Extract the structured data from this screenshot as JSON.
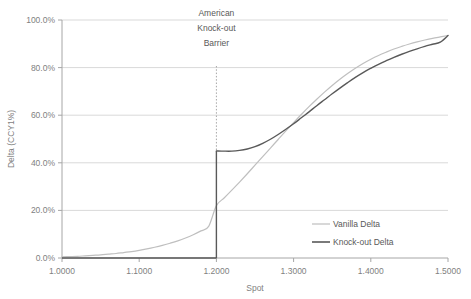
{
  "chart_data": {
    "type": "line",
    "title": "",
    "xlabel": "Spot",
    "ylabel": "Delta (CCY1%)",
    "xlim": [
      1.0,
      1.5
    ],
    "ylim": [
      0.0,
      1.0
    ],
    "grid": true,
    "legend_position": "inside-bottom-right",
    "x_tick_labels": [
      "1.0000",
      "1.1000",
      "1.2000",
      "1.3000",
      "1.4000",
      "1.5000"
    ],
    "x_ticks": [
      1.0,
      1.1,
      1.2,
      1.3,
      1.4,
      1.5
    ],
    "y_tick_labels": [
      "0.0%",
      "20.0%",
      "40.0%",
      "60.0%",
      "80.0%",
      "100.0%"
    ],
    "y_ticks": [
      0.0,
      0.2,
      0.4,
      0.6,
      0.8,
      1.0
    ],
    "annotations": [
      {
        "name": "american-knock-out-barrier",
        "lines": [
          "American",
          "Knock-out",
          "Barrier"
        ],
        "x": 1.2,
        "style": "dashed-vertical-line"
      }
    ],
    "series": [
      {
        "name": "Vanilla Delta",
        "color": "#bfbfbf",
        "x": [
          1.0,
          1.01,
          1.02,
          1.03,
          1.04,
          1.05,
          1.06,
          1.07,
          1.08,
          1.09,
          1.1,
          1.11,
          1.12,
          1.13,
          1.14,
          1.15,
          1.16,
          1.17,
          1.18,
          1.19,
          1.2,
          1.21,
          1.22,
          1.23,
          1.24,
          1.25,
          1.26,
          1.27,
          1.28,
          1.29,
          1.3,
          1.31,
          1.32,
          1.33,
          1.34,
          1.35,
          1.36,
          1.37,
          1.38,
          1.39,
          1.4,
          1.41,
          1.42,
          1.43,
          1.44,
          1.45,
          1.46,
          1.47,
          1.48,
          1.49,
          1.5
        ],
        "values": [
          0.005,
          0.006,
          0.007,
          0.009,
          0.011,
          0.013,
          0.016,
          0.019,
          0.023,
          0.027,
          0.032,
          0.038,
          0.045,
          0.053,
          0.062,
          0.072,
          0.084,
          0.098,
          0.114,
          0.133,
          0.22,
          0.252,
          0.285,
          0.319,
          0.354,
          0.39,
          0.426,
          0.462,
          0.498,
          0.534,
          0.569,
          0.603,
          0.636,
          0.667,
          0.697,
          0.725,
          0.751,
          0.775,
          0.797,
          0.817,
          0.835,
          0.851,
          0.865,
          0.878,
          0.889,
          0.899,
          0.908,
          0.916,
          0.923,
          0.929,
          0.935
        ]
      },
      {
        "name": "Knock-out Delta",
        "color": "#595959",
        "x": [
          1.0,
          1.05,
          1.1,
          1.15,
          1.199,
          1.2,
          1.21,
          1.22,
          1.23,
          1.24,
          1.25,
          1.26,
          1.27,
          1.28,
          1.29,
          1.3,
          1.31,
          1.32,
          1.33,
          1.34,
          1.35,
          1.36,
          1.37,
          1.38,
          1.39,
          1.4,
          1.41,
          1.42,
          1.43,
          1.44,
          1.45,
          1.46,
          1.47,
          1.48,
          1.49,
          1.5
        ],
        "values": [
          0.0,
          0.0,
          0.0,
          0.0,
          0.0,
          0.45,
          0.449,
          0.449,
          0.452,
          0.458,
          0.468,
          0.482,
          0.499,
          0.519,
          0.541,
          0.564,
          0.589,
          0.614,
          0.64,
          0.665,
          0.69,
          0.714,
          0.737,
          0.759,
          0.779,
          0.797,
          0.814,
          0.829,
          0.843,
          0.856,
          0.868,
          0.879,
          0.889,
          0.898,
          0.907,
          0.935
        ],
        "discontinuity": {
          "x": 1.2,
          "from": 0.0,
          "to": 0.45
        }
      }
    ]
  },
  "legend": {
    "items": [
      {
        "label": "Vanilla Delta",
        "color": "#bfbfbf"
      },
      {
        "label": "Knock-out Delta",
        "color": "#595959"
      }
    ]
  },
  "colors": {
    "vanilla": "#bfbfbf",
    "knockout": "#595959",
    "gridline": "#d9d9d9",
    "axis": "#a6a6a6",
    "text": "#7f7f7f",
    "background": "#ffffff"
  }
}
